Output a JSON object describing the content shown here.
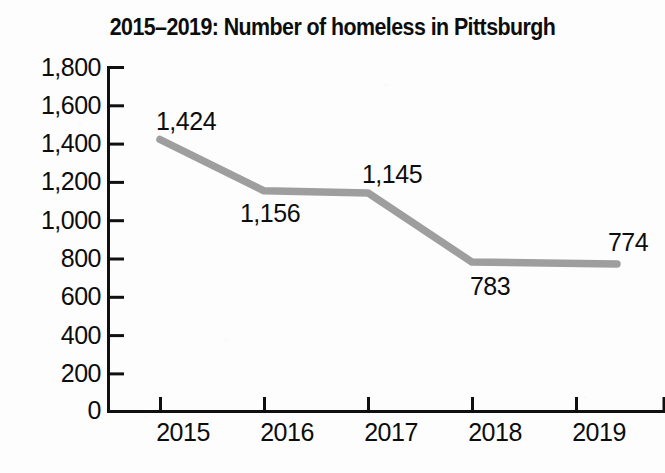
{
  "chart_data": {
    "type": "line",
    "title": "2015–2019: Number of homeless in Pittsburgh",
    "xlabel": "",
    "ylabel": "",
    "categories": [
      "2015",
      "2016",
      "2017",
      "2018",
      "2019"
    ],
    "values": [
      1424,
      1156,
      1145,
      783,
      774
    ],
    "point_labels": [
      "1,424",
      "1,156",
      "1,145",
      "783",
      "774"
    ],
    "point_label_positions": [
      "above",
      "below",
      "above",
      "below",
      "above-right"
    ],
    "ylim": [
      0,
      1800
    ],
    "ytick_values": [
      1800,
      1600,
      1400,
      1200,
      1000,
      800,
      600,
      400,
      200,
      0
    ],
    "ytick_labels": [
      "1,800",
      "1,600",
      "1,400",
      "1,200",
      "1,000",
      "800",
      "600",
      "400",
      "200",
      "0"
    ],
    "grid": false,
    "legend": false,
    "legend_position": "none",
    "series": [
      {
        "name": "Number of homeless",
        "values": [
          1424,
          1156,
          1145,
          783,
          774
        ],
        "color": "#9e9e9e"
      }
    ],
    "colors": {
      "line": "#9e9e9e",
      "axis": "#101010",
      "text": "#0d0d0d",
      "background": "#fdfdfd"
    }
  }
}
